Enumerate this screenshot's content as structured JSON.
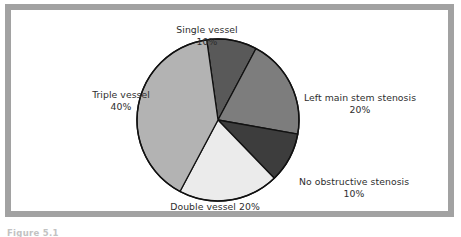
{
  "figure": {
    "caption": "Figure 5.1",
    "frame_color": "#a2a2a2",
    "background_color": "#ffffff"
  },
  "chart_data": {
    "type": "pie",
    "title": "",
    "subtitle": "",
    "xlabel": "",
    "ylabel": "",
    "legend_position": "none",
    "grid": false,
    "start_angle_deg": -8,
    "direction": "clockwise",
    "units": "percent",
    "total": 100,
    "categories": [
      "Single vessel",
      "Left main stem stenosis",
      "No obstructive stenosis",
      "Double vessel",
      "Triple vessel"
    ],
    "values": [
      10,
      20,
      10,
      20,
      40
    ],
    "colors": [
      "#595959",
      "#7d7d7d",
      "#3d3d3d",
      "#ebebeb",
      "#b3b3b3"
    ],
    "slice_outline_color": "#111111",
    "slices": [
      {
        "label": "Single vessel",
        "percent_text": "10%",
        "value": 10,
        "color": "#595959"
      },
      {
        "label": "Left main stem stenosis",
        "percent_text": "20%",
        "value": 20,
        "color": "#7d7d7d"
      },
      {
        "label": "No obstructive stenosis",
        "percent_text": "10%",
        "value": 10,
        "color": "#3d3d3d"
      },
      {
        "label": "Double vessel",
        "percent_text": "20%",
        "value": 20,
        "color": "#ebebeb",
        "label_single_line": "Double vessel 20%"
      },
      {
        "label": "Triple vessel",
        "percent_text": "40%",
        "value": 40,
        "color": "#b3b3b3"
      }
    ]
  }
}
